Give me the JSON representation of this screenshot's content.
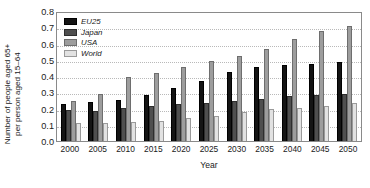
{
  "chart_data": {
    "type": "bar",
    "title": "",
    "xlabel": "Year",
    "ylabel": "Number of people aged 65+ per person aged 15–64",
    "ylabel_line1": "Number of people aged 65+",
    "ylabel_line2": "per person aged 15–64",
    "categories": [
      "2000",
      "2005",
      "2010",
      "2015",
      "2020",
      "2025",
      "2030",
      "2035",
      "2040",
      "2045",
      "2050"
    ],
    "ylim": [
      0.0,
      0.8
    ],
    "ytick_values": [
      "0.8",
      "0.7",
      "0.6",
      "0.5",
      "0.4",
      "0.3",
      "0.2",
      "0.1",
      "0.0"
    ],
    "grid": true,
    "grid_axis": "y",
    "legend_position": "top-left",
    "series": [
      {
        "name": "EU25",
        "color": "#141414",
        "values": [
          0.225,
          0.24,
          0.255,
          0.285,
          0.325,
          0.37,
          0.425,
          0.455,
          0.47,
          0.475,
          0.485
        ]
      },
      {
        "name": "Japan",
        "color": "#4f4f4f",
        "values": [
          0.19,
          0.185,
          0.205,
          0.215,
          0.225,
          0.235,
          0.245,
          0.26,
          0.275,
          0.285,
          0.29
        ]
      },
      {
        "name": "USA",
        "color": "#9d9d9d",
        "values": [
          0.245,
          0.29,
          0.395,
          0.42,
          0.455,
          0.49,
          0.525,
          0.565,
          0.63,
          0.675,
          0.71
        ]
      },
      {
        "name": "World",
        "color": "#e2e2e2",
        "values": [
          0.11,
          0.11,
          0.115,
          0.125,
          0.14,
          0.155,
          0.18,
          0.195,
          0.205,
          0.215,
          0.235
        ]
      }
    ]
  }
}
